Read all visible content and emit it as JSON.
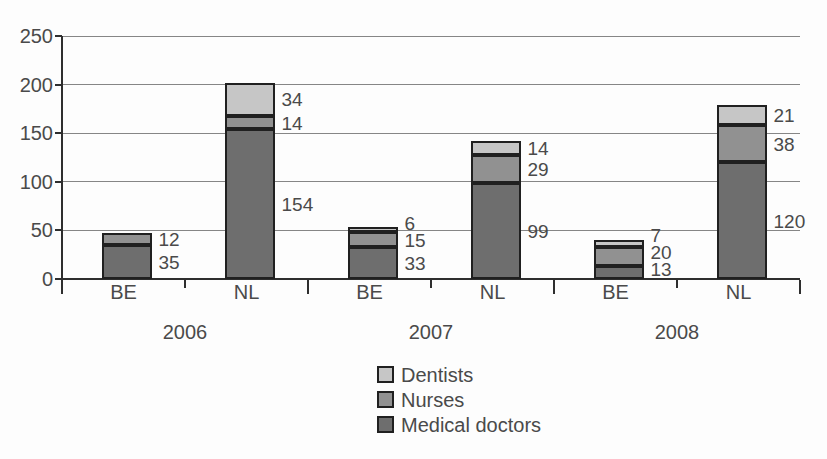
{
  "chart_data": {
    "type": "bar",
    "stacked": true,
    "title": "",
    "xlabel": "",
    "ylabel": "",
    "ylim": [
      0,
      250
    ],
    "yticks": [
      0,
      50,
      100,
      150,
      200,
      250
    ],
    "grid": true,
    "legend_position": "bottom-center",
    "legend_order": [
      "Dentists",
      "Nurses",
      "Medical doctors"
    ],
    "show_data_labels": true,
    "group_labels": [
      "2006",
      "2007",
      "2008"
    ],
    "categories": [
      "BE",
      "NL",
      "BE",
      "NL",
      "BE",
      "NL"
    ],
    "series": [
      {
        "name": "Medical doctors",
        "color": "#6e6e6e",
        "values": [
          35,
          154,
          33,
          99,
          13,
          120
        ]
      },
      {
        "name": "Nurses",
        "color": "#919191",
        "values": [
          12,
          14,
          15,
          29,
          20,
          38
        ]
      },
      {
        "name": "Dentists",
        "color": "#c6c6c6",
        "values": [
          0,
          34,
          6,
          14,
          7,
          21
        ]
      }
    ]
  },
  "colors": {
    "background": "#fdfdfd",
    "text": "#4a4a4a",
    "gridline": "#868686",
    "axis": "#2e2e2e",
    "segment_border": "#202020"
  }
}
